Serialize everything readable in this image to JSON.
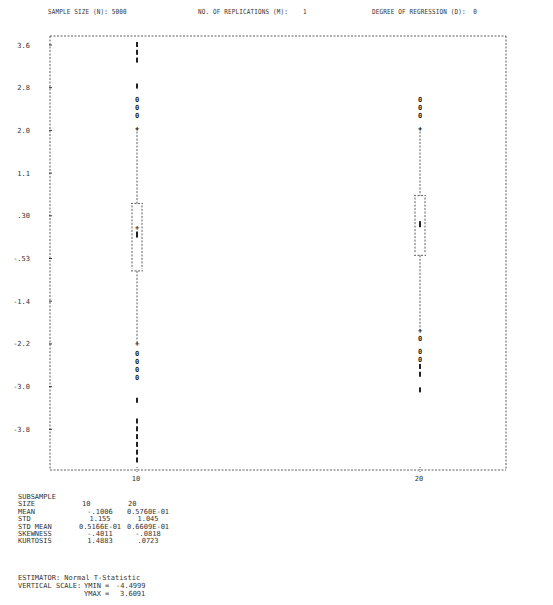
{
  "header": {
    "sample_size": "SAMPLE SIZE (N): 5000",
    "replications": "NO. OF REPLICATIONS (M):    1",
    "regression": "DEGREE OF REGRESSION (D):  0"
  },
  "chart_data": {
    "type": "boxplot",
    "title": "",
    "xlabel": "SUBSAMPLE SIZE",
    "ylabel": "",
    "categories": [
      "10",
      "20"
    ],
    "y_tick_labels": [
      "3.6",
      "2.8",
      "2.0",
      "1.1",
      ".30",
      "-.53",
      "-1.4",
      "-2.2",
      "-3.0",
      "-3.8"
    ],
    "ylim": [
      -4.4999,
      3.6091
    ],
    "grid": false,
    "series": [
      {
        "name": "10",
        "box_q1": -0.75,
        "box_q3": 0.55,
        "median": -0.05,
        "mean": -0.1006,
        "whisker_high": 2.0,
        "whisker_low": -2.15,
        "outliers_high_0": [
          2.55,
          2.4,
          2.25
        ],
        "outliers_high_star": [
          3.6,
          3.45,
          3.3,
          2.8
        ],
        "outliers_low_0": [
          -2.35,
          -2.5,
          -2.65,
          -2.8
        ],
        "outliers_low_star": [
          -3.25,
          -3.65,
          -3.8,
          -3.95,
          -4.1,
          -4.25,
          -4.4
        ]
      },
      {
        "name": "20",
        "box_q1": -0.45,
        "box_q3": 0.7,
        "median": 0.15,
        "mean": 0.0576,
        "whisker_high": 2.0,
        "whisker_low": -1.9,
        "outliers_high_0": [
          2.55,
          2.4,
          2.25
        ],
        "outliers_high_star": [],
        "outliers_low_0": [
          -2.05,
          -2.3,
          -2.45
        ],
        "outliers_low_star": [
          -2.6,
          -2.75,
          -3.05
        ]
      }
    ],
    "legend": []
  },
  "stats": {
    "title": "SUBSAMPLE",
    "rows": [
      {
        "label": "SIZE",
        "v1": "10",
        "v2": "20"
      },
      {
        "label": "MEAN",
        "v1": "-.1006",
        "v2": "0.5760E-01"
      },
      {
        "label": "STD",
        "v1": "1.155",
        "v2": "1.045"
      },
      {
        "label": "STD MEAN",
        "v1": "0.5166E-01",
        "v2": "0.6609E-01"
      },
      {
        "label": "SKEWNESS",
        "v1": "-.4011",
        "v2": "-.0818"
      },
      {
        "label": "KURTOSIS",
        "v1": "1.4883",
        "v2": ".0723"
      }
    ]
  },
  "footer": {
    "estimator": "ESTIMATOR: Normal T-Statistic",
    "vertical_scale_label": "VERTICAL SCALE:",
    "ymin_label": "YMIN =",
    "ymin_value": "-4.4999",
    "ymax_label": "YMAX =",
    "ymax_value": "3.6091"
  }
}
